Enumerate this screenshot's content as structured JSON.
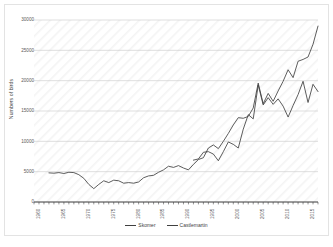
{
  "chart_data": {
    "type": "line",
    "title": "",
    "xlabel": "",
    "ylabel": "Numbers of birds",
    "xlim": [
      1960,
      2017
    ],
    "ylim": [
      0,
      30000
    ],
    "grid": true,
    "legend_position": "bottom",
    "y_ticks": [
      0,
      5000,
      10000,
      15000,
      20000,
      25000,
      30000
    ],
    "y_tick_labels": [
      "0",
      "5000",
      "10000",
      "15000",
      "20000",
      "25000",
      "30000"
    ],
    "x_ticks": [
      1960,
      1965,
      1970,
      1975,
      1980,
      1985,
      1990,
      1995,
      2000,
      2005,
      2010,
      2015
    ],
    "x_tick_labels": [
      "1960",
      "1965",
      "1970",
      "1975",
      "1980",
      "1985",
      "1990",
      "1995",
      "2000",
      "2005",
      "2010",
      "2015"
    ],
    "series": [
      {
        "name": "Skomer",
        "color": "#404040",
        "x": [
          1963,
          1964,
          1965,
          1966,
          1967,
          1968,
          1969,
          1970,
          1971,
          1972,
          1973,
          1974,
          1975,
          1976,
          1977,
          1978,
          1979,
          1980,
          1981,
          1982,
          1983,
          1984,
          1985,
          1986,
          1987,
          1988,
          1989,
          1990,
          1991,
          1992,
          1993,
          1994,
          1995,
          1996,
          1997,
          1998,
          1999,
          2000,
          2001,
          2002,
          2003,
          2004,
          2005,
          2006,
          2007,
          2008,
          2009,
          2010,
          2011,
          2012,
          2013,
          2014,
          2015,
          2016,
          2017
        ],
        "values": [
          4800,
          4750,
          4850,
          4700,
          4900,
          4850,
          4500,
          3900,
          2900,
          2200,
          2900,
          3500,
          3200,
          3600,
          3500,
          3100,
          3200,
          3100,
          3300,
          4000,
          4300,
          4400,
          4900,
          5300,
          5900,
          5700,
          6000,
          5600,
          5300,
          6200,
          7000,
          7300,
          8900,
          9400,
          8800,
          10000,
          11300,
          12700,
          13900,
          13800,
          14100,
          15500,
          19600,
          16200,
          17900,
          16600,
          18300,
          19900,
          21800,
          20500,
          23200,
          23500,
          23900,
          26000,
          29000
        ]
      },
      {
        "name": "Castlemartin",
        "color": "#404040",
        "x": [
          1992,
          1993,
          1994,
          1995,
          1996,
          1997,
          1998,
          1999,
          2000,
          2001,
          2002,
          2003,
          2004,
          2005,
          2006,
          2007,
          2008,
          2009,
          2010,
          2011,
          2012,
          2013,
          2014,
          2015,
          2016,
          2017
        ],
        "values": [
          6900,
          7100,
          8200,
          8300,
          7900,
          6800,
          8300,
          9900,
          9500,
          8900,
          12000,
          14400,
          13700,
          19300,
          16000,
          17200,
          16100,
          17000,
          15800,
          14000,
          15900,
          17700,
          19900,
          16400,
          19400,
          18200
        ]
      }
    ]
  },
  "legend": {
    "entries": [
      {
        "label": "Skomer"
      },
      {
        "label": "Castlemartin"
      }
    ]
  }
}
